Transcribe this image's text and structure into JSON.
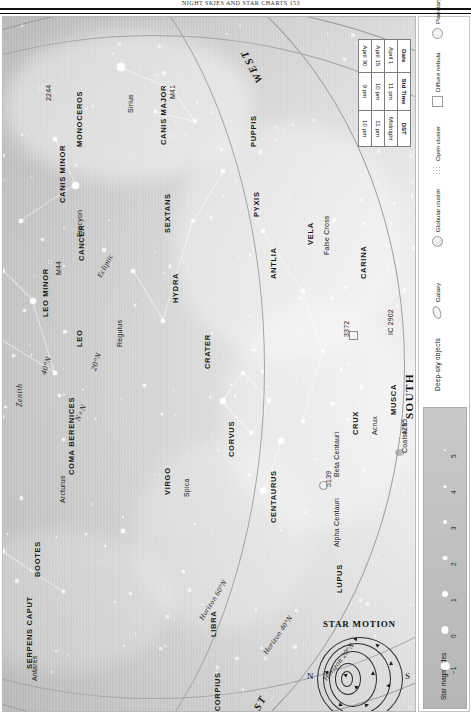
{
  "header": {
    "running_head": "NIGHT SKIES AND STAR CHARTS     153"
  },
  "chart": {
    "compass": {
      "west": "WEST",
      "east": "EAST",
      "south": "SOUTH"
    },
    "zenith_label": "Zenith",
    "latitude_marks": [
      "40°N",
      "20°N",
      "N+N"
    ],
    "horizon_lines": [
      "Horizon 60°N",
      "Horizon 40°N",
      "Horizon 20°N"
    ],
    "constellations": [
      "MONOCEROS",
      "CANIS MAJOR",
      "CANIS MINOR",
      "CANCER",
      "PUPPIS",
      "PYXIS",
      "ANTLIA",
      "VELA",
      "CARINA",
      "HYDRA",
      "SEXTANS",
      "LEO",
      "LEO MINOR",
      "CRATER",
      "CORVUS",
      "VIRGO",
      "COMA BERENICES",
      "BOOTES",
      "SERPENS CAPUT",
      "LIBRA",
      "SCORPIUS",
      "LUPUS",
      "CENTAURUS",
      "CRUX",
      "MUSCA"
    ],
    "named_stars": [
      "Sirius",
      "Procyon",
      "Regulus",
      "Spica",
      "Arcturus",
      "Antares",
      "Acrux",
      "Alpha Centauri",
      "Beta Centauri"
    ],
    "deep_sky_labels": [
      "2244",
      "M41",
      "M44",
      "3372",
      "IC 2902",
      "4755",
      "Coalsack",
      "5139"
    ],
    "feature_labels": [
      "False Cross",
      "Ecliptic"
    ]
  },
  "time_table": {
    "columns": [
      "Date",
      "Std Time",
      "DST"
    ],
    "rows": [
      {
        "date": "April 1",
        "std": "11 pm",
        "dst": "Midnight"
      },
      {
        "date": "April 15",
        "std": "10 pm",
        "dst": "11 pm"
      },
      {
        "date": "April 30",
        "std": "9 pm",
        "dst": "10 pm"
      }
    ]
  },
  "legend": {
    "deep_sky_title": "Deep-sky objects",
    "items": [
      {
        "name": "Galaxy",
        "icon": "galaxy-icon"
      },
      {
        "name": "Globular\ncluster",
        "icon": "globular-cluster-icon"
      },
      {
        "name": "Open\ncluster",
        "icon": "open-cluster-icon"
      },
      {
        "name": "Diffuse\nnebula",
        "icon": "diffuse-nebula-icon"
      },
      {
        "name": "Planetary\nnebula",
        "icon": "planetary-nebula-icon"
      }
    ],
    "magnitude_title": "Star magnitudes",
    "magnitudes": [
      "−1",
      "0",
      "1",
      "2",
      "3",
      "4",
      "5"
    ]
  },
  "star_motion": {
    "title": "STAR MOTION",
    "north": "N",
    "south": "S"
  },
  "colors": {
    "sky_bright": "#f7f7f7",
    "sky_dark": "#a2a2a2",
    "ink": "#1c1c1c",
    "rule": "#111111",
    "legend_strip": "#c0c0c0"
  }
}
